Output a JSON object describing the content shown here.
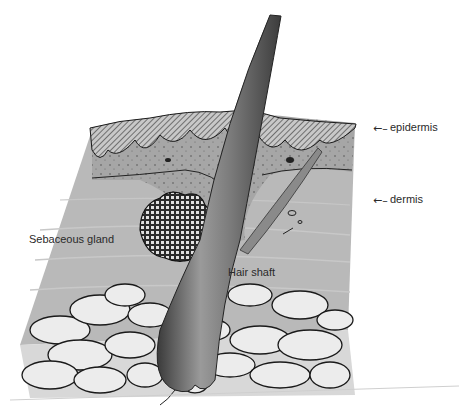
{
  "diagram": {
    "labels": {
      "epidermis": "epidermis",
      "dermis": "dermis",
      "sebaceous_gland": "Sebaceous gland",
      "hair_shaft": "Hair shaft"
    },
    "arrows": {
      "epidermis": "←–",
      "dermis": "←–"
    },
    "colors": {
      "background": "#ffffff",
      "dermis": "#b8b8b8",
      "epidermis": "#9a9a9a",
      "hair": "#6a6a6a",
      "fat": "#ececec",
      "outline": "#1a1a1a"
    }
  }
}
